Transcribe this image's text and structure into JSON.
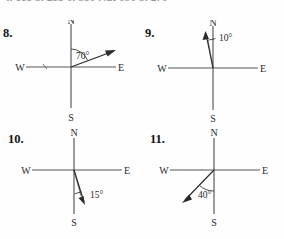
{
  "page": {
    "background_color": "#fefefe",
    "ink_color": "#2a2a2a",
    "axis_color": "#555555"
  },
  "answer_strip": {
    "visible_fragment": "4. 115    5. 255    6. 350    Nat 090    8. 270",
    "items": [
      {
        "label": "4.",
        "value": "115"
      },
      {
        "label": "5.",
        "value": "255"
      },
      {
        "label": "6.",
        "value": "350"
      },
      {
        "label": "Nat",
        "value": "090"
      },
      {
        "label": "8.",
        "value": "270"
      }
    ]
  },
  "problems": [
    {
      "number": "8.",
      "cardinals": {
        "n": "N",
        "e": "E",
        "s": "S",
        "w": "W"
      },
      "angle_label": "70°",
      "angle_value": 70,
      "measured_from": "N",
      "rotation_direction": "clockwise",
      "ray_bearing_deg": 70,
      "description": "arrow pointing east-north-east, 70 degrees clockwise from North"
    },
    {
      "number": "9.",
      "cardinals": {
        "n": "N",
        "e": "E",
        "s": "S",
        "w": "W"
      },
      "angle_label": "10°",
      "angle_value": 10,
      "measured_from": "N",
      "rotation_direction": "counterclockwise",
      "ray_bearing_deg": 350,
      "description": "arrow pointing nearly due North, tilted 10 degrees toward West"
    },
    {
      "number": "10.",
      "cardinals": {
        "n": "N",
        "e": "E",
        "s": "S",
        "w": "W"
      },
      "angle_label": "15°",
      "angle_value": 15,
      "measured_from": "S",
      "rotation_direction": "counterclockwise",
      "ray_bearing_deg": 165,
      "description": "arrow pointing nearly due South, tilted 15 degrees toward East"
    },
    {
      "number": "11.",
      "cardinals": {
        "n": "N",
        "e": "E",
        "s": "S",
        "w": "W"
      },
      "angle_label": "40°",
      "angle_value": 40,
      "measured_from": "S",
      "rotation_direction": "clockwise",
      "ray_bearing_deg": 220,
      "description": "arrow pointing south-west, 40 degrees from South toward West"
    }
  ]
}
